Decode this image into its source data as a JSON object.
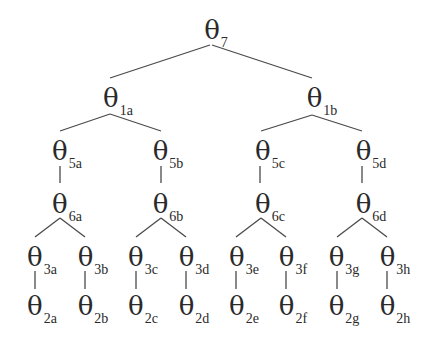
{
  "diagram": {
    "type": "tree",
    "symbol": "θ",
    "line_color": "#4a4a4a",
    "nodes": [
      {
        "id": "7",
        "sub": "7",
        "x": 210,
        "y": 30
      },
      {
        "id": "1a",
        "sub": "1a",
        "x": 108,
        "y": 98
      },
      {
        "id": "1b",
        "sub": "1b",
        "x": 313,
        "y": 98
      },
      {
        "id": "5a",
        "sub": "5a",
        "x": 59,
        "y": 151
      },
      {
        "id": "5b",
        "sub": "5b",
        "x": 160,
        "y": 151
      },
      {
        "id": "5c",
        "sub": "5c",
        "x": 262,
        "y": 151
      },
      {
        "id": "5d",
        "sub": "5d",
        "x": 363,
        "y": 151
      },
      {
        "id": "6a",
        "sub": "6a",
        "x": 59,
        "y": 204
      },
      {
        "id": "6b",
        "sub": "6b",
        "x": 160,
        "y": 204
      },
      {
        "id": "6c",
        "sub": "6c",
        "x": 262,
        "y": 204
      },
      {
        "id": "6d",
        "sub": "6d",
        "x": 363,
        "y": 204
      },
      {
        "id": "3a",
        "sub": "3a",
        "x": 34,
        "y": 257
      },
      {
        "id": "3b",
        "sub": "3b",
        "x": 86,
        "y": 257
      },
      {
        "id": "3c",
        "sub": "3c",
        "x": 136,
        "y": 257
      },
      {
        "id": "3d",
        "sub": "3d",
        "x": 187,
        "y": 257
      },
      {
        "id": "3e",
        "sub": "3e",
        "x": 237,
        "y": 257
      },
      {
        "id": "3f",
        "sub": "3f",
        "x": 287,
        "y": 257
      },
      {
        "id": "3g",
        "sub": "3g",
        "x": 337,
        "y": 257
      },
      {
        "id": "3h",
        "sub": "3h",
        "x": 388,
        "y": 257
      },
      {
        "id": "2a",
        "sub": "2a",
        "x": 34,
        "y": 306
      },
      {
        "id": "2b",
        "sub": "2b",
        "x": 86,
        "y": 306
      },
      {
        "id": "2c",
        "sub": "2c",
        "x": 136,
        "y": 306
      },
      {
        "id": "2d",
        "sub": "2d",
        "x": 187,
        "y": 306
      },
      {
        "id": "2e",
        "sub": "2e",
        "x": 237,
        "y": 306
      },
      {
        "id": "2f",
        "sub": "2f",
        "x": 287,
        "y": 306
      },
      {
        "id": "2g",
        "sub": "2g",
        "x": 337,
        "y": 306
      },
      {
        "id": "2h",
        "sub": "2h",
        "x": 388,
        "y": 306
      }
    ],
    "edges": [
      [
        "7",
        "1a"
      ],
      [
        "7",
        "1b"
      ],
      [
        "1a",
        "5a"
      ],
      [
        "1a",
        "5b"
      ],
      [
        "1b",
        "5c"
      ],
      [
        "1b",
        "5d"
      ],
      [
        "5a",
        "6a"
      ],
      [
        "5b",
        "6b"
      ],
      [
        "5c",
        "6c"
      ],
      [
        "5d",
        "6d"
      ],
      [
        "6a",
        "3a"
      ],
      [
        "6a",
        "3b"
      ],
      [
        "6b",
        "3c"
      ],
      [
        "6b",
        "3d"
      ],
      [
        "6c",
        "3e"
      ],
      [
        "6c",
        "3f"
      ],
      [
        "6d",
        "3g"
      ],
      [
        "6d",
        "3h"
      ],
      [
        "3a",
        "2a"
      ],
      [
        "3b",
        "2b"
      ],
      [
        "3c",
        "2c"
      ],
      [
        "3d",
        "2d"
      ],
      [
        "3e",
        "2e"
      ],
      [
        "3f",
        "2f"
      ],
      [
        "3g",
        "2g"
      ],
      [
        "3h",
        "2h"
      ]
    ]
  }
}
